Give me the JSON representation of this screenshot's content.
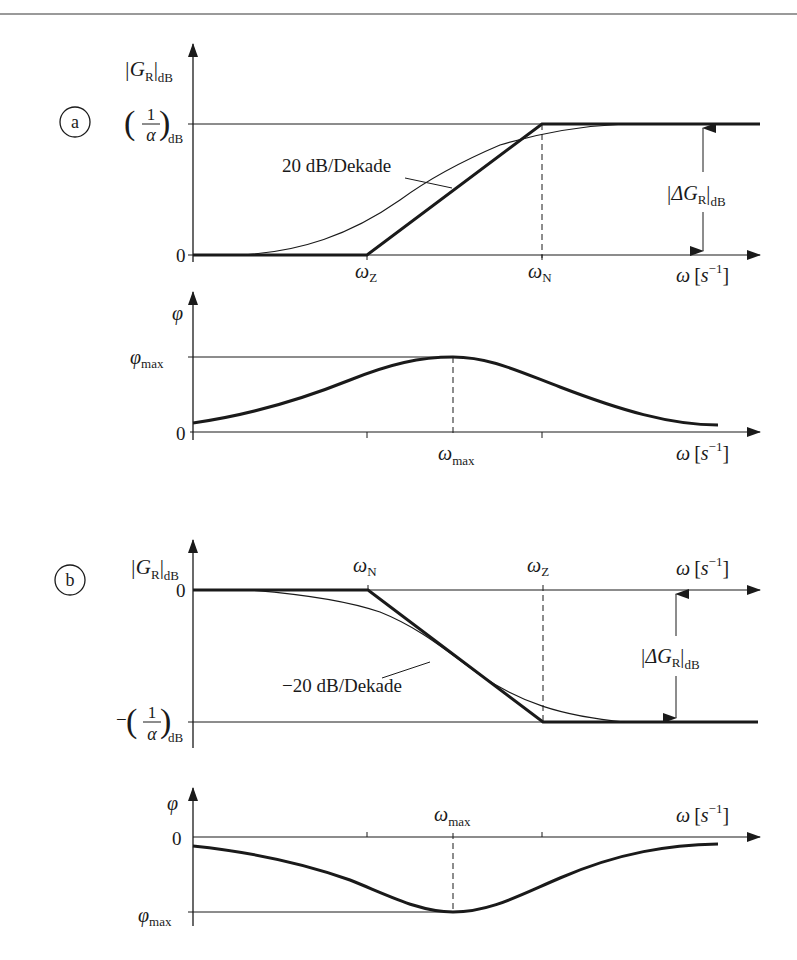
{
  "page": {
    "header_rule_color": "#9a9a9a",
    "ink_color": "#1a1a1a"
  },
  "diagram_a": {
    "marker": "a",
    "magnitude": {
      "y_axis_label_main": "|G",
      "y_axis_label_sub": "R",
      "y_axis_label_tail": "|",
      "y_axis_label_unit": "dB",
      "level_high_num": "1",
      "level_high_den": "α",
      "level_high_unit": "dB",
      "level_zero": "0",
      "slope_label": "20 dB/Dekade",
      "corner1_main": "ω",
      "corner1_sub": "Z",
      "corner2_main": "ω",
      "corner2_sub": "N",
      "x_axis_label": "ω",
      "x_axis_unit_open": "[",
      "x_axis_unit_s": "s",
      "x_axis_unit_exp": "−1",
      "x_axis_unit_close": "]",
      "delta_main": "|ΔG",
      "delta_sub": "R",
      "delta_tail": "|",
      "delta_unit": "dB"
    },
    "phase": {
      "y_axis_label": "φ",
      "level_max_main": "φ",
      "level_max_sub": "max",
      "level_zero": "0",
      "peak_main": "ω",
      "peak_sub": "max",
      "x_axis_label": "ω",
      "x_axis_unit_open": "[",
      "x_axis_unit_s": "s",
      "x_axis_unit_exp": "−1",
      "x_axis_unit_close": "]"
    }
  },
  "diagram_b": {
    "marker": "b",
    "magnitude": {
      "y_axis_label_main": "|G",
      "y_axis_label_sub": "R",
      "y_axis_label_tail": "|",
      "y_axis_label_unit": "dB",
      "level_zero": "0",
      "level_low_sign": "−",
      "level_low_num": "1",
      "level_low_den": "α",
      "level_low_unit": "dB",
      "slope_label": "−20 dB/Dekade",
      "corner1_main": "ω",
      "corner1_sub": "N",
      "corner2_main": "ω",
      "corner2_sub": "Z",
      "x_axis_label": "ω",
      "x_axis_unit_open": "[",
      "x_axis_unit_s": "s",
      "x_axis_unit_exp": "−1",
      "x_axis_unit_close": "]",
      "delta_main": "|ΔG",
      "delta_sub": "R",
      "delta_tail": "|",
      "delta_unit": "dB"
    },
    "phase": {
      "y_axis_label": "φ",
      "level_zero": "0",
      "level_max_main": "φ",
      "level_max_sub": "max",
      "peak_main": "ω",
      "peak_sub": "max",
      "x_axis_label": "ω",
      "x_axis_unit_open": "[",
      "x_axis_unit_s": "s",
      "x_axis_unit_exp": "−1",
      "x_axis_unit_close": "]"
    }
  }
}
